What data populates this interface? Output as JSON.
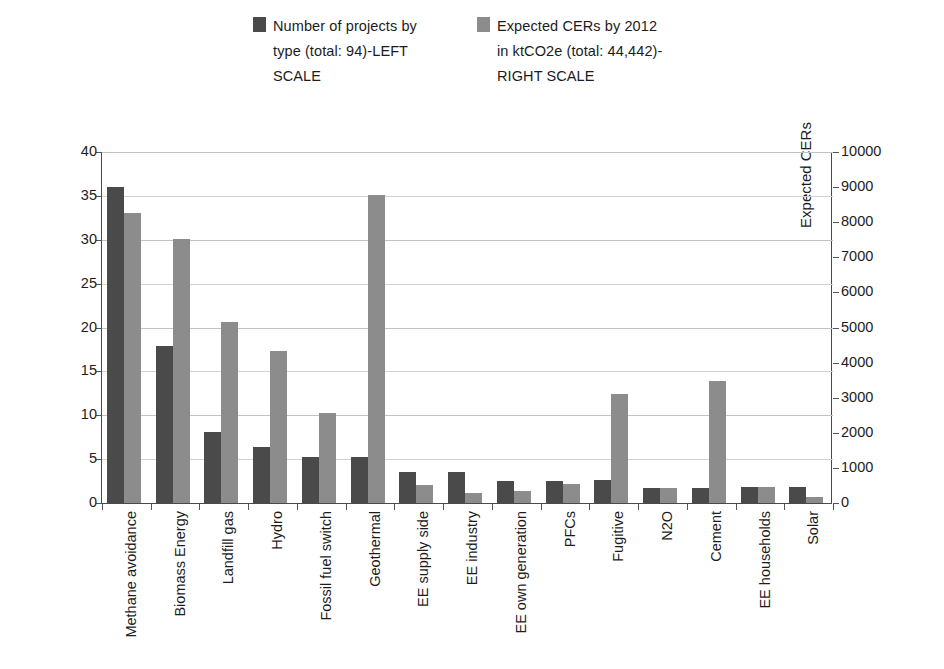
{
  "legend": {
    "entries": [
      {
        "name": "series-projects",
        "color": "#4a4a4a",
        "label": "Number of projects by\ntype (total: 94)-LEFT\nSCALE"
      },
      {
        "name": "series-cers",
        "color": "#8c8c8c",
        "label": "Expected CERs by 2012\nin ktCO2e (total: 44,442)-\nRIGHT SCALE"
      }
    ]
  },
  "axes": {
    "left_title": "No. of CDM projects",
    "right_title": "Expected CERs",
    "left_ticks": [
      "0",
      "5",
      "10",
      "15",
      "20",
      "25",
      "30",
      "35",
      "40"
    ],
    "right_ticks": [
      "0",
      "1000",
      "2000",
      "3000",
      "4000",
      "5000",
      "6000",
      "7000",
      "8000",
      "9000",
      "10000"
    ]
  },
  "chart_data": {
    "type": "bar",
    "title": "",
    "xlabel": "",
    "ylabel": "No. of CDM projects",
    "y2label": "Expected CERs",
    "ylim": [
      0,
      40
    ],
    "y2lim": [
      0,
      10000
    ],
    "grid": true,
    "legend_position": "top",
    "categories": [
      "Methane avoidance",
      "Biomass Energy",
      "Landfill gas",
      "Hydro",
      "Fossil fuel switch",
      "Geothermal",
      "EE supply side",
      "EE industry",
      "EE own generation",
      "PFCs",
      "Fugitive",
      "N2O",
      "Cement",
      "EE households",
      "Solar"
    ],
    "series": [
      {
        "name": "Number of projects by type (total: 94)-LEFT SCALE",
        "axis": "left",
        "units": "projects",
        "color": "#4a4a4a",
        "values": [
          36,
          17.9,
          8.1,
          6.4,
          5.3,
          5.3,
          3.5,
          3.5,
          2.5,
          2.5,
          2.6,
          1.7,
          1.7,
          1.8,
          1.8
        ]
      },
      {
        "name": "Expected CERs by 2012 in ktCO2e (total: 44,442)-RIGHT SCALE",
        "axis": "right",
        "units": "ktCO2e",
        "color": "#8c8c8c",
        "values_right_scale": [
          8250,
          7530,
          5150,
          4320,
          2570,
          8780,
          530,
          270,
          350,
          550,
          3090,
          430,
          3470,
          450,
          170
        ],
        "values": [
          33,
          30.1,
          20.6,
          17.3,
          10.3,
          35.1,
          2.1,
          1.1,
          1.4,
          2.2,
          12.4,
          1.7,
          13.9,
          1.8,
          0.7
        ]
      }
    ]
  }
}
